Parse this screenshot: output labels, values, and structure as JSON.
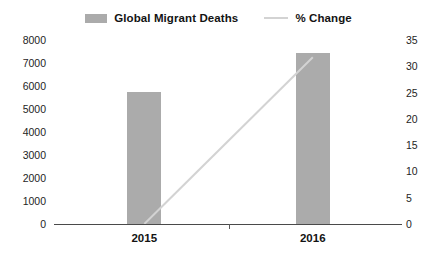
{
  "chart_data": {
    "type": "bar",
    "title": "",
    "subtitle": "",
    "xlabel": "",
    "ylabel": "",
    "y2label": "",
    "categories": [
      "2015",
      "2016"
    ],
    "series": [
      {
        "name": "Global Migrant Deaths",
        "type": "bar",
        "axis": "left",
        "color": "#ababab",
        "values": [
          5750,
          7430
        ]
      },
      {
        "name": "% Change",
        "type": "line",
        "axis": "right",
        "color": "#d3d3d3",
        "values": [
          0,
          31.7
        ]
      }
    ],
    "ylim": [
      0,
      8000
    ],
    "yticks": [
      "0",
      "1000",
      "2000",
      "3000",
      "4000",
      "5000",
      "6000",
      "7000",
      "8000"
    ],
    "y2lim": [
      0,
      35
    ],
    "y2ticks": [
      "0",
      "5",
      "10",
      "15",
      "20",
      "25",
      "30",
      "35"
    ],
    "grid": false,
    "legend_position": "top-center",
    "legend": [
      {
        "label": "Global Migrant Deaths",
        "marker": "bar-swatch-icon",
        "color": "#ababab"
      },
      {
        "label": "% Change",
        "marker": "line-swatch-icon",
        "color": "#d3d3d3"
      }
    ]
  },
  "axes": {
    "left_ticks": [
      {
        "label": "8000",
        "value": 8000
      },
      {
        "label": "7000",
        "value": 7000
      },
      {
        "label": "6000",
        "value": 6000
      },
      {
        "label": "5000",
        "value": 5000
      },
      {
        "label": "4000",
        "value": 4000
      },
      {
        "label": "3000",
        "value": 3000
      },
      {
        "label": "2000",
        "value": 2000
      },
      {
        "label": "1000",
        "value": 1000
      },
      {
        "label": "0",
        "value": 0
      }
    ],
    "right_ticks": [
      {
        "label": "35",
        "value": 35
      },
      {
        "label": "30",
        "value": 30
      },
      {
        "label": "25",
        "value": 25
      },
      {
        "label": "20",
        "value": 20
      },
      {
        "label": "15",
        "value": 15
      },
      {
        "label": "10",
        "value": 10
      },
      {
        "label": "5",
        "value": 5
      },
      {
        "label": "0",
        "value": 0
      }
    ],
    "x_ticks": [
      {
        "label": "2015"
      },
      {
        "label": "2016"
      }
    ]
  }
}
